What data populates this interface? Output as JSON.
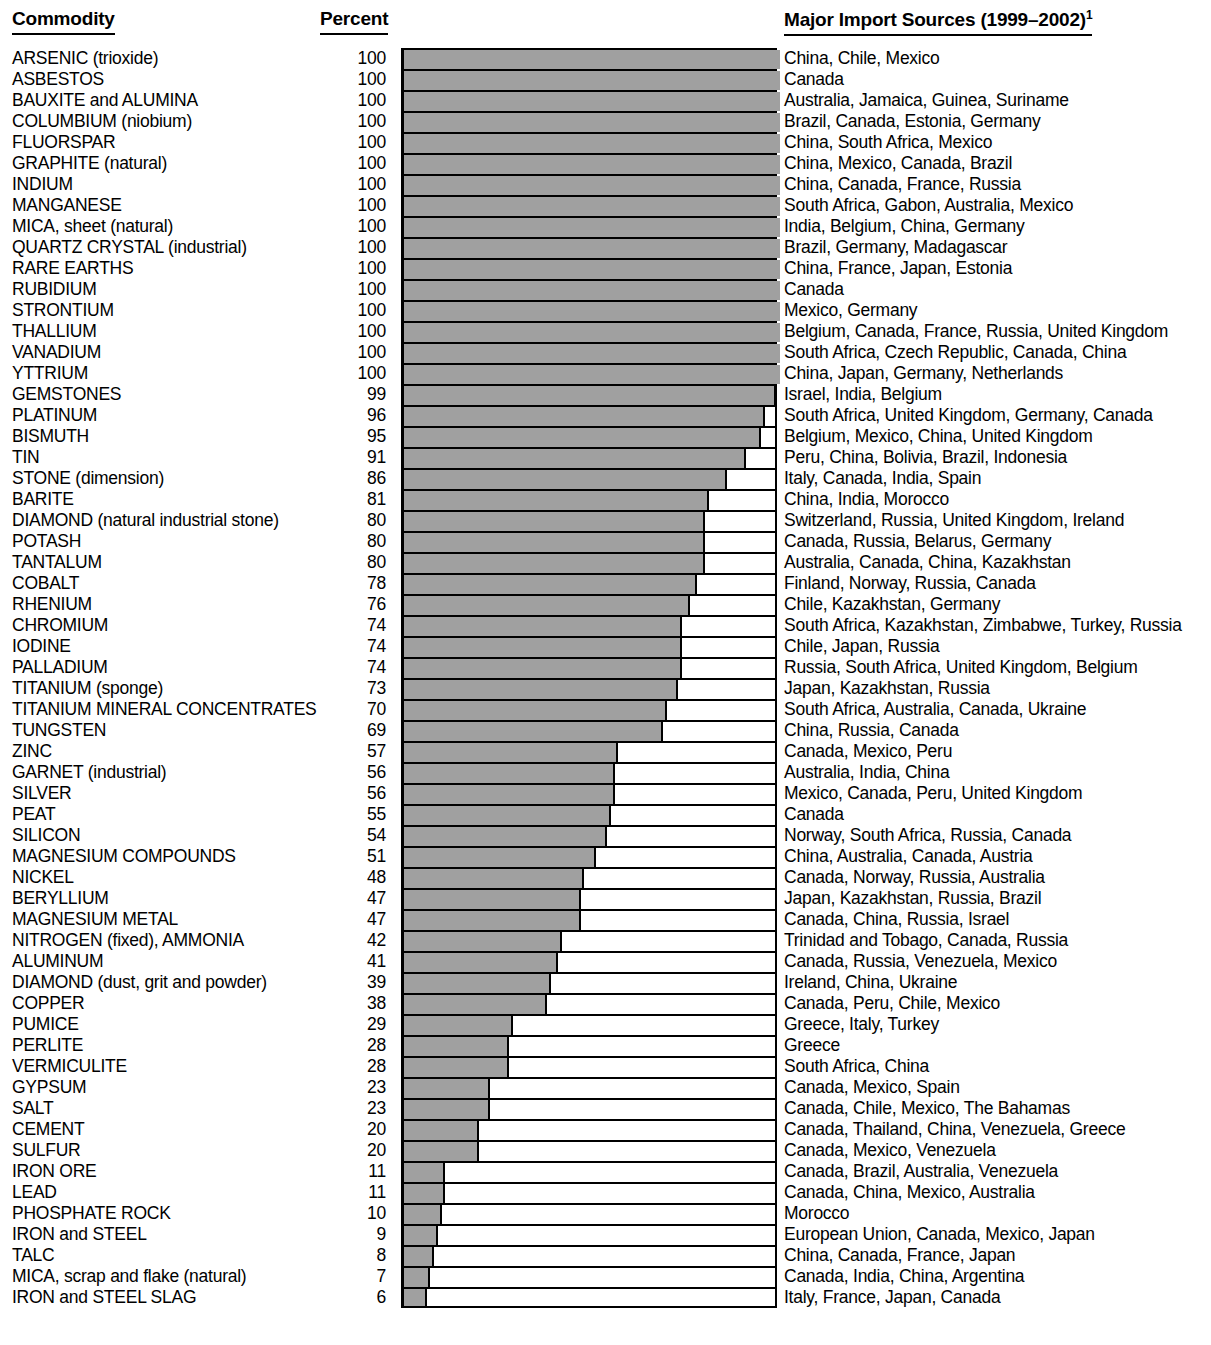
{
  "header": {
    "commodity": "Commodity",
    "percent": "Percent",
    "sources": "Major Import Sources (1999–2002)",
    "sources_footnote": "1"
  },
  "chart_data": {
    "type": "bar",
    "title": "",
    "xlabel": "Percent",
    "ylabel": "Commodity",
    "orientation": "horizontal",
    "xlim": [
      0,
      100
    ],
    "grid": false,
    "legend": null,
    "categories": [
      "ARSENIC (trioxide)",
      "ASBESTOS",
      "BAUXITE and ALUMINA",
      "COLUMBIUM (niobium)",
      "FLUORSPAR",
      "GRAPHITE (natural)",
      "INDIUM",
      "MANGANESE",
      "MICA, sheet (natural)",
      "QUARTZ CRYSTAL (industrial)",
      "RARE EARTHS",
      "RUBIDIUM",
      "STRONTIUM",
      "THALLIUM",
      "VANADIUM",
      "YTTRIUM",
      "GEMSTONES",
      "PLATINUM",
      "BISMUTH",
      "TIN",
      "STONE (dimension)",
      "BARITE",
      "DIAMOND (natural industrial stone)",
      "POTASH",
      "TANTALUM",
      "COBALT",
      "RHENIUM",
      "CHROMIUM",
      "IODINE",
      "PALLADIUM",
      "TITANIUM (sponge)",
      "TITANIUM MINERAL CONCENTRATES",
      "TUNGSTEN",
      "ZINC",
      "GARNET (industrial)",
      "SILVER",
      "PEAT",
      "SILICON",
      "MAGNESIUM COMPOUNDS",
      "NICKEL",
      "BERYLLIUM",
      "MAGNESIUM METAL",
      "NITROGEN (fixed), AMMONIA",
      "ALUMINUM",
      "DIAMOND (dust, grit and powder)",
      "COPPER",
      "PUMICE",
      "PERLITE",
      "VERMICULITE",
      "GYPSUM",
      "SALT",
      "CEMENT",
      "SULFUR",
      "IRON ORE",
      "LEAD",
      "PHOSPHATE ROCK",
      "IRON and STEEL",
      "TALC",
      "MICA, scrap and flake (natural)",
      "IRON and STEEL SLAG"
    ],
    "values": [
      100,
      100,
      100,
      100,
      100,
      100,
      100,
      100,
      100,
      100,
      100,
      100,
      100,
      100,
      100,
      100,
      99,
      96,
      95,
      91,
      86,
      81,
      80,
      80,
      80,
      78,
      76,
      74,
      74,
      74,
      73,
      70,
      69,
      57,
      56,
      56,
      55,
      54,
      51,
      48,
      47,
      47,
      42,
      41,
      39,
      38,
      29,
      28,
      28,
      23,
      23,
      20,
      20,
      11,
      11,
      10,
      9,
      8,
      7,
      6
    ],
    "sources": [
      "China, Chile, Mexico",
      "Canada",
      "Australia, Jamaica, Guinea, Suriname",
      "Brazil, Canada, Estonia, Germany",
      "China, South Africa, Mexico",
      "China, Mexico, Canada, Brazil",
      "China, Canada, France, Russia",
      "South Africa, Gabon, Australia, Mexico",
      "India, Belgium, China, Germany",
      "Brazil, Germany, Madagascar",
      "China, France, Japan, Estonia",
      "Canada",
      "Mexico, Germany",
      "Belgium, Canada, France, Russia, United Kingdom",
      "South Africa, Czech Republic, Canada, China",
      "China, Japan, Germany, Netherlands",
      "Israel, India, Belgium",
      "South Africa, United Kingdom, Germany, Canada",
      "Belgium, Mexico, China, United Kingdom",
      "Peru, China, Bolivia, Brazil, Indonesia",
      "Italy, Canada, India, Spain",
      "China, India, Morocco",
      "Switzerland, Russia, United Kingdom, Ireland",
      "Canada, Russia, Belarus, Germany",
      "Australia, Canada, China, Kazakhstan",
      "Finland, Norway, Russia, Canada",
      "Chile, Kazakhstan, Germany",
      "South Africa, Kazakhstan, Zimbabwe, Turkey, Russia",
      "Chile, Japan, Russia",
      "Russia, South Africa, United Kingdom, Belgium",
      "Japan, Kazakhstan, Russia",
      "South Africa, Australia, Canada, Ukraine",
      "China, Russia, Canada",
      "Canada, Mexico, Peru",
      "Australia, India, China",
      "Mexico, Canada, Peru, United Kingdom",
      "Canada",
      "Norway, South Africa, Russia, Canada",
      "China, Australia, Canada, Austria",
      "Canada, Norway, Russia, Australia",
      "Japan, Kazakhstan, Russia, Brazil",
      "Canada, China, Russia, Israel",
      "Trinidad and Tobago, Canada, Russia",
      "Canada, Russia, Venezuela, Mexico",
      "Ireland, China, Ukraine",
      "Canada, Peru, Chile, Mexico",
      "Greece, Italy, Turkey",
      "Greece",
      "South Africa, China",
      "Canada, Mexico, Spain",
      "Canada, Chile, Mexico, The Bahamas",
      "Canada, Thailand, China, Venezuela, Greece",
      "Canada, Mexico, Venezuela",
      "Canada, Brazil, Australia, Venezuela",
      "Canada, China, Mexico, Australia",
      "Morocco",
      "European Union, Canada, Mexico, Japan",
      "China, Canada, France, Japan",
      "Canada, India, China, Argentina",
      "Italy, France, Japan, Canada"
    ],
    "colors": {
      "bar_fill": "#a0a0a0",
      "bar_outline": "#000000",
      "text": "#000000",
      "background": "#ffffff"
    }
  }
}
